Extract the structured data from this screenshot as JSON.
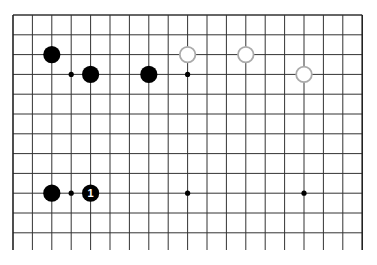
{
  "board": {
    "columns": 19,
    "visible_rows": 12,
    "origin_x": 13,
    "origin_y": 15,
    "spacing_x": 19.4,
    "spacing_y": 19.8,
    "line_extend_bottom": 250,
    "line_color": "#333333",
    "edge_color": "#222222"
  },
  "star_points": [
    {
      "col": 3,
      "row": 3
    },
    {
      "col": 9,
      "row": 3
    },
    {
      "col": 3,
      "row": 9
    },
    {
      "col": 9,
      "row": 9
    },
    {
      "col": 15,
      "row": 9
    }
  ],
  "stones": [
    {
      "color": "black",
      "col": 2,
      "row": 2,
      "label": ""
    },
    {
      "color": "black",
      "col": 4,
      "row": 3,
      "label": ""
    },
    {
      "color": "black",
      "col": 7,
      "row": 3,
      "label": ""
    },
    {
      "color": "white",
      "col": 9,
      "row": 2,
      "label": ""
    },
    {
      "color": "white",
      "col": 12,
      "row": 2,
      "label": ""
    },
    {
      "color": "white",
      "col": 15,
      "row": 3,
      "label": ""
    },
    {
      "color": "black",
      "col": 2,
      "row": 9,
      "label": ""
    },
    {
      "color": "black",
      "col": 4,
      "row": 9,
      "label": "1"
    }
  ],
  "colors": {
    "black_stone": "#000000",
    "white_stone_fill": "#ffffff",
    "white_stone_stroke": "#aaaaaa"
  }
}
